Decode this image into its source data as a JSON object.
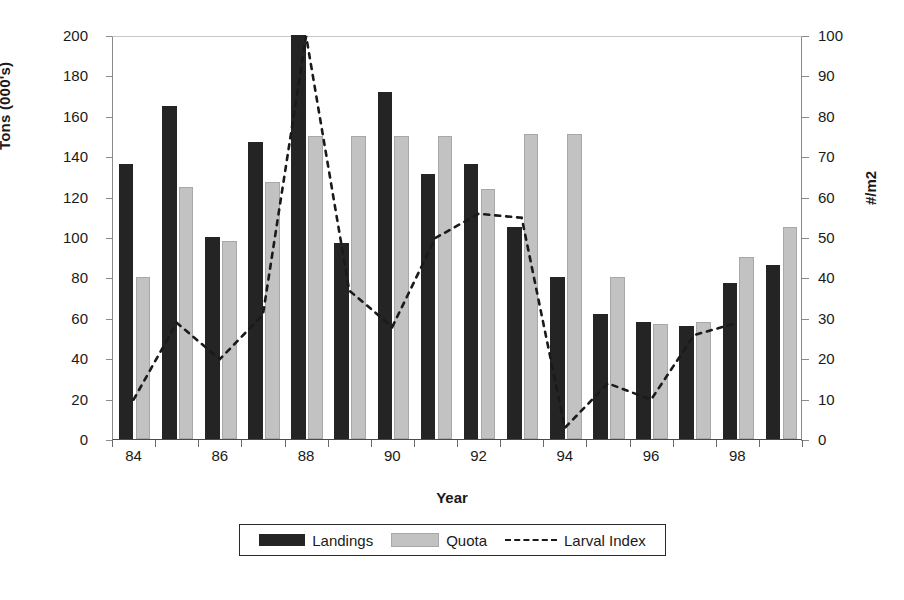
{
  "chart_data": {
    "type": "bar",
    "title": "",
    "xlabel": "Year",
    "ylabel": "Tons (000's)",
    "y2label": "#/m2",
    "grid": false,
    "legend_position": "bottom",
    "categories": [
      "84",
      "85",
      "86",
      "87",
      "88",
      "89",
      "90",
      "91",
      "92",
      "93",
      "94",
      "95",
      "96",
      "97",
      "98",
      "99"
    ],
    "xtick_labels": [
      "84",
      "86",
      "88",
      "90",
      "92",
      "94",
      "96",
      "98"
    ],
    "ylim": [
      0,
      200
    ],
    "yticks": [
      0,
      20,
      40,
      60,
      80,
      100,
      120,
      140,
      160,
      180,
      200
    ],
    "y2lim": [
      0,
      100
    ],
    "y2ticks": [
      0,
      10,
      20,
      30,
      40,
      50,
      60,
      70,
      80,
      90,
      100
    ],
    "series": [
      {
        "name": "Landings",
        "kind": "bar",
        "axis": "left",
        "color": "#242424",
        "values": [
          136,
          165,
          100,
          147,
          200,
          97,
          172,
          131,
          136,
          105,
          80,
          62,
          58,
          56,
          77,
          86
        ]
      },
      {
        "name": "Quota",
        "kind": "bar",
        "axis": "left",
        "color": "#c2c2c2",
        "values": [
          80,
          125,
          98,
          127,
          150,
          150,
          150,
          150,
          124,
          151,
          151,
          80,
          57,
          58,
          90,
          105
        ]
      },
      {
        "name": "Larval Index",
        "kind": "line-dashed",
        "axis": "right",
        "color": "#1a1a1a",
        "values": [
          10,
          29,
          20,
          31,
          100,
          37,
          28,
          50,
          56,
          55,
          3,
          14,
          10,
          26,
          29,
          null
        ]
      }
    ]
  },
  "axes": {
    "left_title": "Tons (000's)",
    "right_title": "#/m2",
    "x_title": "Year"
  },
  "legend": {
    "items": [
      {
        "label": "Landings",
        "swatch": "dark-bar-swatch"
      },
      {
        "label": "Quota",
        "swatch": "light-bar-swatch"
      },
      {
        "label": "Larval Index",
        "swatch": "dashed-line-swatch"
      }
    ]
  }
}
